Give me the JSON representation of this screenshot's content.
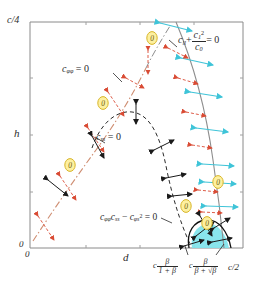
{
  "figure": {
    "type": "phase-diagram",
    "background": "#ffffff",
    "frame_color": "#8a8a8a"
  },
  "axes": {
    "x_label": "d",
    "y_label": "h",
    "x_origin_label": "0",
    "y_origin_label": "0",
    "y_top_label": "c/4",
    "x_right_label": "c/2"
  },
  "bottom_ticks": [
    {
      "id": "tick-beta-1plusbeta",
      "prefix": "c",
      "numerator": "β",
      "denominator": "1 + β"
    },
    {
      "id": "tick-beta-sqrtbeta",
      "prefix": "c",
      "numerator": "β",
      "denominator": "β + √β"
    }
  ],
  "annotations": {
    "c_phiphi": {
      "base": "c",
      "sub": "φφ",
      "eq": "= 0"
    },
    "c_ss": {
      "base": "c",
      "sub": "ss",
      "eq": "= 0"
    },
    "c_ll_formula": {
      "base": "c",
      "sub": "ll",
      "plus": "+",
      "frac_num_base": "c",
      "frac_num_sub": "1",
      "frac_num_sup": "2",
      "frac_den_base": "c",
      "frac_den_sub": "0",
      "eq": "= 0"
    },
    "determinant": {
      "t1_base": "c",
      "t1_sub": "φφ",
      "t2_base": "c",
      "t2_sub": "ss",
      "minus": "−",
      "t3_base": "c",
      "t3_sub": "φs",
      "t3_sup": "2",
      "eq": "= 0"
    }
  },
  "colors": {
    "cyan_fill": "#7fe3ea",
    "cyan_stroke": "#3fc4d8",
    "orange": "#e8744a",
    "red": "#d94b34",
    "yellow_fill": "#fdf0a0",
    "yellow_stroke": "#d8b62a",
    "gray_curve": "#8d8d8d",
    "black": "#1a1a1a",
    "frame": "#8a8a8a"
  },
  "zero_markers": {
    "label": "0",
    "positions": [
      {
        "x": 152,
        "y": 38
      },
      {
        "x": 103,
        "y": 103
      },
      {
        "x": 70,
        "y": 165
      },
      {
        "x": 218,
        "y": 182
      },
      {
        "x": 186,
        "y": 206
      },
      {
        "x": 207,
        "y": 223
      }
    ]
  },
  "curves": [
    {
      "name": "c-phiphi-zero-curve",
      "style": "dash-dot",
      "color": "#e8744a",
      "description": "lower-left dash-dot curve rising to upper middle"
    },
    {
      "name": "c-ss-zero-curve",
      "style": "dashed",
      "color": "#1a1a1a",
      "description": "central dashed arch"
    },
    {
      "name": "c-ll-zero-curve",
      "style": "solid",
      "color": "#8d8d8d",
      "description": "right near-vertical curve"
    },
    {
      "name": "determinant-zero-curve",
      "style": "solid",
      "color": "#1a1a1a",
      "description": "closed loop around cyan region"
    }
  ],
  "regions": [
    {
      "name": "unstable-region",
      "fill": "#7fe3ea",
      "description": "cyan shaded lens at bottom right"
    }
  ]
}
